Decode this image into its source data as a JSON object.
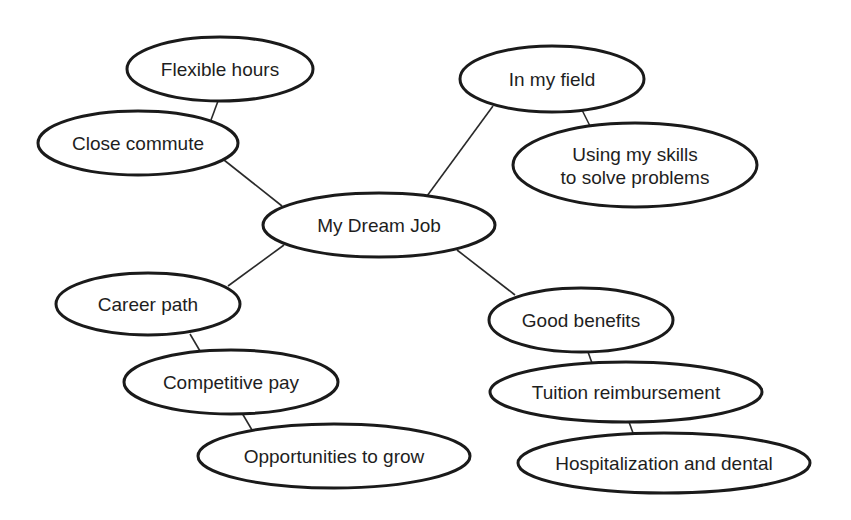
{
  "diagram": {
    "type": "mind-map",
    "center": {
      "id": "dream",
      "label": "My Dream Job",
      "cx": 379,
      "cy": 225,
      "rx": 116,
      "ry": 32
    },
    "nodes": [
      {
        "id": "flex",
        "label": "Flexible hours",
        "cx": 220,
        "cy": 69,
        "rx": 93,
        "ry": 32
      },
      {
        "id": "commute",
        "label": "Close commute",
        "cx": 138,
        "cy": 143,
        "rx": 100,
        "ry": 32
      },
      {
        "id": "field",
        "label": "In my field",
        "cx": 552,
        "cy": 79,
        "rx": 92,
        "ry": 33
      },
      {
        "id": "skills",
        "label": "Using my skills",
        "label2": "to solve problems",
        "cx": 635,
        "cy": 165,
        "rx": 122,
        "ry": 42
      },
      {
        "id": "career",
        "label": "Career path",
        "cx": 148,
        "cy": 304,
        "rx": 92,
        "ry": 31
      },
      {
        "id": "pay",
        "label": "Competitive pay",
        "cx": 231,
        "cy": 382,
        "rx": 107,
        "ry": 32
      },
      {
        "id": "grow",
        "label": "Opportunities to grow",
        "cx": 334,
        "cy": 456,
        "rx": 136,
        "ry": 32
      },
      {
        "id": "benefits",
        "label": "Good benefits",
        "cx": 581,
        "cy": 320,
        "rx": 92,
        "ry": 32
      },
      {
        "id": "tuition",
        "label": "Tuition reimbursement",
        "cx": 626,
        "cy": 392,
        "rx": 136,
        "ry": 30
      },
      {
        "id": "hospital",
        "label": "Hospitalization and dental",
        "cx": 664,
        "cy": 463,
        "rx": 146,
        "ry": 30
      }
    ],
    "edges": [
      {
        "from": "flex",
        "to": "commute",
        "x1": 218,
        "y1": 101,
        "x2": 211,
        "y2": 120
      },
      {
        "from": "commute",
        "to": "dream",
        "x1": 224,
        "y1": 160,
        "x2": 282,
        "y2": 206
      },
      {
        "from": "dream",
        "to": "field",
        "x1": 427,
        "y1": 196,
        "x2": 493,
        "y2": 106
      },
      {
        "from": "field",
        "to": "skills",
        "x1": 582,
        "y1": 110,
        "x2": 590,
        "y2": 126
      },
      {
        "from": "dream",
        "to": "career",
        "x1": 284,
        "y1": 245,
        "x2": 228,
        "y2": 286
      },
      {
        "from": "career",
        "to": "pay",
        "x1": 190,
        "y1": 334,
        "x2": 200,
        "y2": 351
      },
      {
        "from": "pay",
        "to": "grow",
        "x1": 242,
        "y1": 413,
        "x2": 252,
        "y2": 430
      },
      {
        "from": "dream",
        "to": "benefits",
        "x1": 457,
        "y1": 250,
        "x2": 515,
        "y2": 295
      },
      {
        "from": "benefits",
        "to": "tuition",
        "x1": 588,
        "y1": 352,
        "x2": 592,
        "y2": 363
      },
      {
        "from": "tuition",
        "to": "hospital",
        "x1": 629,
        "y1": 422,
        "x2": 633,
        "y2": 433
      }
    ]
  }
}
